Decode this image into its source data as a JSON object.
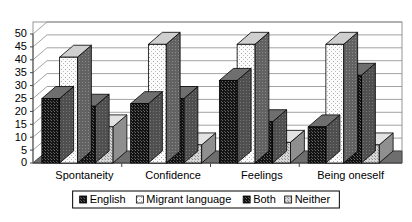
{
  "chart_data": {
    "type": "bar",
    "title": "",
    "subtitle": "",
    "xlabel": "",
    "ylabel": "",
    "grid": true,
    "legend_position": "bottom",
    "ylim": [
      0,
      50
    ],
    "ytick_labels": [
      "0",
      "5",
      "10",
      "15",
      "20",
      "25",
      "30",
      "35",
      "40",
      "45",
      "50"
    ],
    "ytick_values": [
      0,
      5,
      10,
      15,
      20,
      25,
      30,
      35,
      40,
      45,
      50
    ],
    "categories": [
      "Spontaneity",
      "Confidence",
      "Feelings",
      "Being oneself"
    ],
    "series": [
      {
        "name": "English",
        "values": [
          25,
          23,
          32,
          14
        ]
      },
      {
        "name": "Migrant language",
        "values": [
          41,
          46,
          46,
          46
        ]
      },
      {
        "name": "Both",
        "values": [
          22,
          25,
          16,
          34
        ]
      },
      {
        "name": "Neither",
        "values": [
          14,
          7,
          8,
          7
        ]
      }
    ]
  },
  "legend": {
    "items": [
      {
        "label": "English",
        "swatch": "dark-dotted"
      },
      {
        "label": "Migrant language",
        "swatch": "white-dotted"
      },
      {
        "label": "Both",
        "swatch": "dark-dotted"
      },
      {
        "label": "Neither",
        "swatch": "light-dotted"
      }
    ]
  },
  "colors": {
    "english_face": "#1c1c1c",
    "migrant_face": "#f2f2f2",
    "both_face": "#1c1c1c",
    "neither_face": "#cfcfcf",
    "side_shade": "#5a5a5a",
    "top_shade": "#9a9a9a",
    "gridline": "#8a8a8a",
    "axis": "#4a4a4a",
    "floor": "#6e6e6e",
    "background": "#ffffff"
  }
}
